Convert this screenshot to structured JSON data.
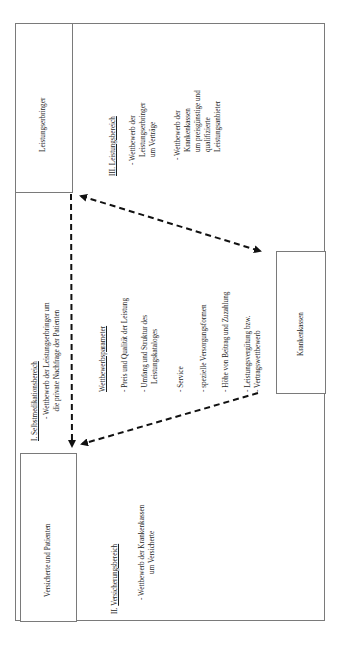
{
  "diagram": {
    "orientation": "rotated -90deg (text reads bottom-to-top)",
    "actors": {
      "leistungserbringer": "Leistungserbringer",
      "versicherte": "Versicherte und Patienten",
      "krankenkassen": "Krankenkassen"
    },
    "areas": {
      "selbstmedikation": {
        "title": "I. Selbstmedikationsbereich",
        "bullets": [
          [
            "- Wettbewerb der Leistungserbringer um",
            "die private Nachfrage der Patienten"
          ]
        ]
      },
      "versicherung": {
        "title_prefix": "II. ",
        "title": "Versicherungsbereich",
        "bullets": [
          [
            "- Wettbewerb der Krankenkassen",
            "um Versicherte"
          ]
        ]
      },
      "leistung": {
        "title": "III. Leistungsbereich",
        "bullets": [
          [
            "- Wettbewerb der",
            "Leistungserbringer",
            "um Verträge"
          ],
          [
            "- Wettbewerb der",
            "Krankenkassen",
            "um  preisgünstige und",
            "qualifizierte",
            "Leistungsanbieter"
          ]
        ]
      }
    },
    "parameters": {
      "title": "Wettbewerbsparameter",
      "items": [
        [
          "- Preis und Qualität der Leistung"
        ],
        [
          "- Umfang und Struktur des",
          "Leistungskataloges"
        ],
        [
          "- Service"
        ],
        [
          "- spezielle Versorgungsformen"
        ],
        [
          "- Höhe von Beitrag und Zuzahlung"
        ],
        [
          "- Leistungsvergütung bzw.",
          "- Vertragswettbewerb"
        ]
      ]
    },
    "edges": [
      {
        "from": "leistungserbringer",
        "to": "versicherte",
        "style": "dashed",
        "arrow": "end"
      },
      {
        "from": "leistungserbringer",
        "to": "krankenkassen",
        "style": "dashed",
        "arrow": "both"
      },
      {
        "from": "krankenkassen",
        "to": "versicherte",
        "style": "dashed",
        "arrow": "end"
      }
    ]
  }
}
